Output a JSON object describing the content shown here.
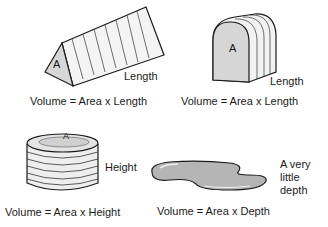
{
  "panels": [
    {
      "shape": "triangular-prism",
      "area_label": "A",
      "dimension_label": "Length",
      "formula": "Volume = Area x Length"
    },
    {
      "shape": "arched-prism",
      "area_label": "A",
      "dimension_label": "Length",
      "formula": "Volume = Area x Length"
    },
    {
      "shape": "cylinder",
      "area_label": "A",
      "dimension_label": "Height",
      "formula": "Volume = Area x Height"
    },
    {
      "shape": "puddle",
      "area_label": "",
      "dimension_label": "A very little depth",
      "dimension_lines": [
        "A very",
        "little",
        "depth"
      ],
      "formula": "Volume = Area x Depth"
    }
  ],
  "colors": {
    "face_fill": "#d4d4d4",
    "side_fill": "#f2f2f2",
    "puddle_fill": "#b5b5b5",
    "stroke": "#1a1a1a"
  }
}
